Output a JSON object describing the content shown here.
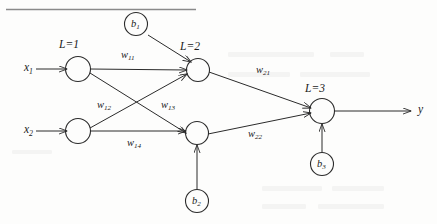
{
  "figure": {
    "type": "neural-network-diagram"
  },
  "inputs": [
    {
      "id": "x1",
      "label": "x",
      "sub": "1"
    },
    {
      "id": "x2",
      "label": "x",
      "sub": "2"
    }
  ],
  "output": {
    "id": "y",
    "label": "y",
    "sub": ""
  },
  "layers": [
    {
      "id": "L1",
      "label": "L=1"
    },
    {
      "id": "L2",
      "label": "L=2"
    },
    {
      "id": "L3",
      "label": "L=3"
    }
  ],
  "biases": [
    {
      "id": "b1",
      "label": "b",
      "sub": "1"
    },
    {
      "id": "b2",
      "label": "b",
      "sub": "2"
    },
    {
      "id": "b3",
      "label": "b",
      "sub": "3"
    }
  ],
  "weights": [
    {
      "id": "w11",
      "label": "w",
      "sub": "11"
    },
    {
      "id": "w12",
      "label": "w",
      "sub": "12"
    },
    {
      "id": "w13",
      "label": "w",
      "sub": "13"
    },
    {
      "id": "w14",
      "label": "w",
      "sub": "14"
    },
    {
      "id": "w21",
      "label": "w",
      "sub": "21"
    },
    {
      "id": "w22",
      "label": "w",
      "sub": "22"
    }
  ],
  "colors": {
    "ink": "#1a1a1a",
    "stroke": "#2b2b2b",
    "paper": "#fdfdfc",
    "rule": "#8a8a8a"
  }
}
